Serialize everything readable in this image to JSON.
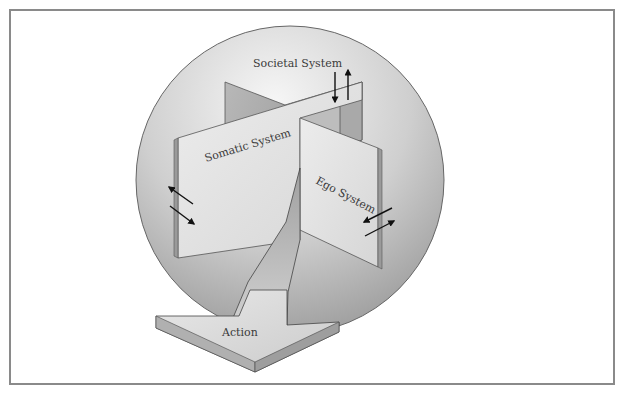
{
  "diagram": {
    "labels": {
      "societal": "Societal System",
      "somatic": "Somatic System",
      "ego": "Ego System",
      "action": "Action"
    },
    "colors": {
      "frame_border": "#8a8a8a",
      "sphere_light": "#f4f4f4",
      "sphere_dark": "#9c9c9c",
      "panel_light": "#e4e4e4",
      "panel_mid": "#c8c8c8",
      "panel_dark": "#a4a4a4",
      "arrow": "#111111",
      "text": "#3a3a3a"
    }
  }
}
